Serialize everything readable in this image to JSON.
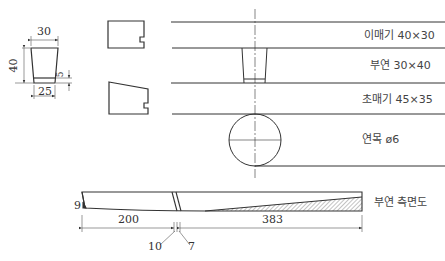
{
  "figure": {
    "colors": {
      "line": "#333333",
      "hatch": "#999999",
      "text": "#333333"
    },
    "block_section": {
      "dims": {
        "top_width": "30",
        "height": "40",
        "bottom_width": "25",
        "lip": "5"
      }
    },
    "layers": [
      {
        "label": "이매기 40×30"
      },
      {
        "label": "부연 30×40"
      },
      {
        "label": "초매기 45×35"
      },
      {
        "label": "연목 ø6"
      }
    ],
    "side_view": {
      "label": "부연 측면도",
      "dims": {
        "tip": "9",
        "left_length": "200",
        "right_length": "383",
        "slot_a": "10",
        "slot_b": "7"
      }
    }
  }
}
